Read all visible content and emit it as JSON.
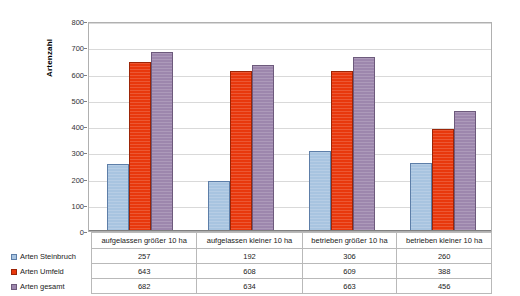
{
  "chart_data": {
    "type": "bar",
    "title": "",
    "xlabel": "",
    "ylabel": "Artenzahl",
    "ylim": [
      0,
      800
    ],
    "ytick_step": 100,
    "yticks": [
      0,
      100,
      200,
      300,
      400,
      500,
      600,
      700,
      800
    ],
    "grid": true,
    "legend_position": "data-table-left",
    "categories": [
      "aufgelassen größer 10 ha",
      "aufgelassen kleiner 10 ha",
      "betrieben größer 10 ha",
      "betrieben kleiner 10 ha"
    ],
    "series": [
      {
        "name": "Arten Steinbruch",
        "color": "#a8c4e0",
        "values": [
          257,
          192,
          306,
          260
        ]
      },
      {
        "name": "Arten Umfeld",
        "color": "#e8380d",
        "values": [
          643,
          608,
          609,
          388
        ]
      },
      {
        "name": "Arten gesamt",
        "color": "#9d87ad",
        "values": [
          682,
          634,
          663,
          456
        ]
      }
    ]
  },
  "axis": {
    "y_title": "Artenzahl",
    "y_tick_labels": [
      "800",
      "700",
      "600",
      "500",
      "400",
      "300",
      "200",
      "100",
      "0"
    ]
  },
  "table": {
    "row_labels": [
      "Arten Steinbruch",
      "Arten Umfeld",
      "Arten gesamt"
    ],
    "category_headers": [
      "aufgelassen größer 10 ha",
      "aufgelassen kleiner 10 ha",
      "betrieben größer 10 ha",
      "betrieben kleiner 10 ha"
    ],
    "rows": [
      [
        "257",
        "192",
        "306",
        "260"
      ],
      [
        "643",
        "608",
        "609",
        "388"
      ],
      [
        "682",
        "634",
        "663",
        "456"
      ]
    ]
  },
  "colors": {
    "series_1": "#a8c4e0",
    "series_2": "#e8380d",
    "series_3": "#9d87ad",
    "grid": "#d9d9d9",
    "frame": "#b0b0b0"
  }
}
